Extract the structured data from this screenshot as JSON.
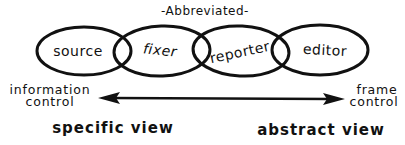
{
  "diagram": {
    "title": "-Abbreviated-",
    "roles": [
      {
        "label": "source"
      },
      {
        "label": "fixer"
      },
      {
        "label": "reporter"
      },
      {
        "label": "editor"
      }
    ],
    "spectrum": {
      "left_label_line1": "information",
      "left_label_line2": "control",
      "right_label_line1": "frame",
      "right_label_line2": "control",
      "left_view": "specific view",
      "right_view": "abstract view",
      "arrow": "double-headed"
    }
  },
  "colors": {
    "ink": "#111111",
    "background": "#ffffff"
  }
}
